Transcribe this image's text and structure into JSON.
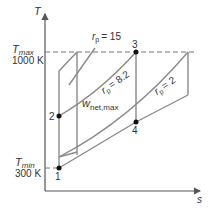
{
  "diagram": {
    "type": "T-s diagram, Brayton cycle",
    "axes": {
      "y_label": "T",
      "x_label": "s"
    },
    "levels": {
      "tmax": {
        "symbol": "T",
        "sub": "max",
        "value": "1000 K"
      },
      "tmin": {
        "symbol": "T",
        "sub": "min",
        "value": "300 K"
      }
    },
    "points": [
      "1",
      "2",
      "3",
      "4"
    ],
    "pressure_ratios": [
      {
        "symbol": "r",
        "sub": "p",
        "value": "= 15"
      },
      {
        "symbol": "r",
        "sub": "p",
        "value": "= 8.2"
      },
      {
        "symbol": "r",
        "sub": "p",
        "value": "= 2"
      }
    ],
    "work_label": {
      "symbol": "w",
      "sub": "net,max"
    }
  }
}
